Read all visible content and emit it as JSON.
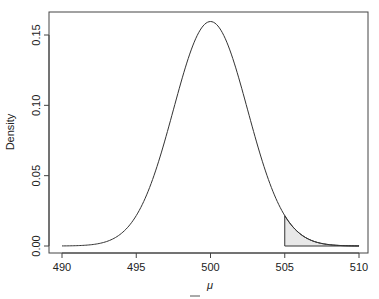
{
  "chart_data": {
    "type": "area",
    "title": "",
    "xlabel": "μ",
    "ylabel": "Density",
    "xlim": [
      490,
      510
    ],
    "ylim": [
      0,
      0.16
    ],
    "grid": false,
    "distribution": {
      "kind": "normal",
      "mean": 500,
      "sd": 2.5
    },
    "shaded_region": {
      "from": 505,
      "to": 510,
      "fill": "#e8e8e8"
    },
    "x_ticks": [
      490,
      495,
      500,
      505,
      510
    ],
    "x_tick_labels": [
      "490",
      "495",
      "500",
      "505",
      "510"
    ],
    "y_ticks": [
      0.0,
      0.05,
      0.1,
      0.15
    ],
    "y_tick_labels": [
      "0.00",
      "0.05",
      "0.10",
      "0.15"
    ],
    "peak_density": 0.16,
    "sample_points": {
      "x": [
        490,
        492,
        494,
        495,
        496,
        497,
        498,
        499,
        500,
        501,
        502,
        503,
        504,
        505,
        506,
        508,
        510
      ],
      "y": [
        0.0001,
        0.0009,
        0.0089,
        0.0216,
        0.0444,
        0.0777,
        0.1158,
        0.1473,
        0.1596,
        0.1473,
        0.1158,
        0.0777,
        0.0444,
        0.0216,
        0.0089,
        0.0009,
        0.0001
      ]
    },
    "extra_mark_below_axis": "x̄"
  },
  "labels": {
    "ylabel": "Density",
    "xlabel": "μ",
    "xbar_mark": "‾"
  }
}
